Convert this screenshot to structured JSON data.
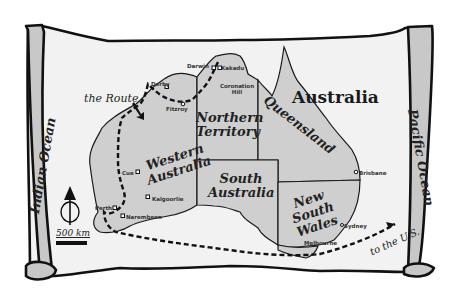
{
  "map": {
    "title": "Australia",
    "route_label": "the Route",
    "destination_label": "to the U.S.",
    "scale_label": "500 km",
    "compass_label": "north-arrow",
    "oceans": [
      "Indian Ocean",
      "Pacific Ocean"
    ],
    "regions": {
      "western_australia": "Western Australia",
      "northern_territory": "Northern Territory",
      "south_australia": "South Australia",
      "queensland": "Queensland",
      "new_south_wales": "New South Wales"
    },
    "cities": {
      "darwin": "Darwin",
      "kakadu": "Kakadu",
      "coronation_hill": "Coronation Hill",
      "derby": "Derby",
      "fitzroy": "Fitzroy",
      "cue": "Cue",
      "kalgoorlie": "Kalgoorlie",
      "perth": "Perth",
      "narembeen": "Narembeen",
      "brisbane": "Brisbane",
      "sydney": "Sydney",
      "melbourne": "Melbourne"
    },
    "colors": {
      "land": "#cfcfcf",
      "parchment": "#f2f2f2",
      "ink": "#111111"
    }
  }
}
